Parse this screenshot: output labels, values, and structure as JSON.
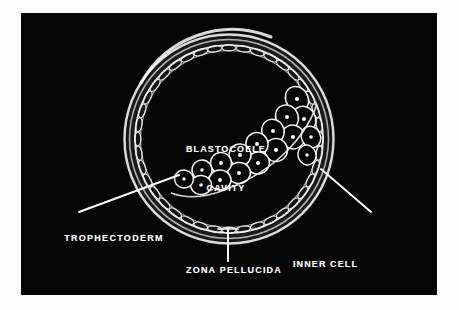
{
  "figure": {
    "plate_background": "#050505",
    "ink_color": "#ffffff",
    "page_background": "#fdfdfd",
    "labels": {
      "blastocoele": "BLASTOCOELE\nCAVITY",
      "blastocoele_line1": "BLASTOCOELE",
      "blastocoele_line2": "CAVITY",
      "trophectoderm": "TROPHECTODERM",
      "inner_cell_mass": "INNER CELL\nMASS",
      "inner_cell_mass_line1": "INNER CELL",
      "inner_cell_mass_line2": "MASS",
      "zona_pellucida": "ZONA PELLUCIDA"
    },
    "structures": [
      {
        "name": "zona-pellucida",
        "description": "smooth outer acellular ring enclosing the embryo"
      },
      {
        "name": "trophectoderm",
        "description": "single layer of flattened epithelial cells lining the inside of the zona"
      },
      {
        "name": "blastocoele-cavity",
        "description": "large fluid filled cavity occupying the centre"
      },
      {
        "name": "inner-cell-mass",
        "description": "eccentric cluster of rounded nucleated cells at the lower right pole"
      }
    ],
    "leader_lines": [
      {
        "name": "trophectoderm-leader",
        "from": "TROPHECTODERM",
        "to": "trophectoderm"
      },
      {
        "name": "inner-cell-mass-leader",
        "from": "INNER CELL MASS",
        "to": "inner-cell-mass"
      },
      {
        "name": "zona-pellucida-leader",
        "from": "ZONA PELLUCIDA",
        "to": "zona-pellucida"
      }
    ]
  }
}
